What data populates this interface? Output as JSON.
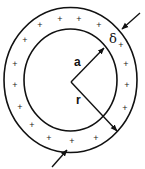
{
  "diagram": {
    "colors": {
      "stroke": "#111111",
      "background": "#ffffff"
    },
    "center": {
      "x": 70.5,
      "y": 81
    },
    "outer_circle": {
      "rx": 66.5,
      "ry": 72.5
    },
    "inner_circle": {
      "rx": 46.5,
      "ry": 51
    },
    "labels": {
      "a": "a",
      "r": "r",
      "delta": "δ"
    },
    "charge_symbol": "+",
    "charges": [
      {
        "x": 40,
        "y": 25
      },
      {
        "x": 60,
        "y": 19
      },
      {
        "x": 79,
        "y": 19
      },
      {
        "x": 99,
        "y": 25
      },
      {
        "x": 25,
        "y": 40
      },
      {
        "x": 15,
        "y": 64
      },
      {
        "x": 15,
        "y": 85
      },
      {
        "x": 20,
        "y": 107
      },
      {
        "x": 32,
        "y": 125
      },
      {
        "x": 49,
        "y": 138
      },
      {
        "x": 72,
        "y": 141
      },
      {
        "x": 96,
        "y": 138
      },
      {
        "x": 121,
        "y": 45
      },
      {
        "x": 126,
        "y": 64
      },
      {
        "x": 127,
        "y": 85
      },
      {
        "x": 125,
        "y": 108
      }
    ]
  }
}
